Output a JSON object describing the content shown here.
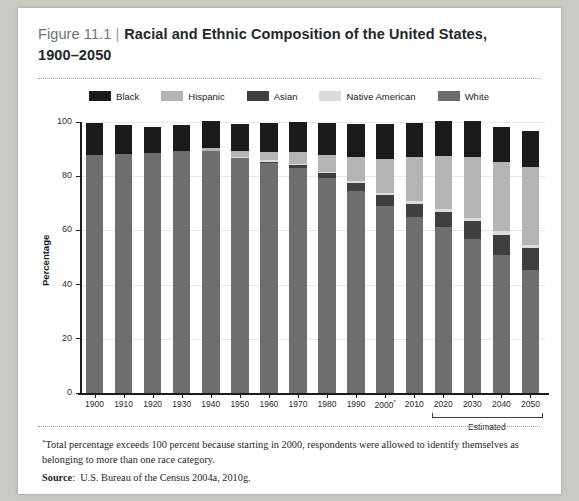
{
  "figure": {
    "label": "Figure 11.1",
    "separator": "|",
    "title_line1": "Racial and Ethnic Composition of the United States,",
    "title_line2": "1900–2050"
  },
  "footnote": {
    "marker": "*",
    "text": "Total percentage exceeds 100 percent because starting in 2000, respondents were allowed to identify themselves as belonging to more than one race category.",
    "source_label": "Source",
    "source_sep": ":",
    "source_text": "U.S. Bureau of the Census 2004a, 2010g."
  },
  "colors": {
    "black": "#1b1b1b",
    "hispanic": "#b4b4b4",
    "asian": "#3f3f3f",
    "native_american": "#dcdcdc",
    "white": "#6e6e6e",
    "axis": "#1d1d1d",
    "grid": "#e8e8e8",
    "plot_bg": "#ffffff",
    "page_bg": "#ffffff",
    "canvas_bg": "#c9c9c4"
  },
  "chart_data": {
    "type": "bar",
    "stacked": true,
    "title": "Racial and Ethnic Composition of the United States, 1900–2050",
    "xlabel": "",
    "ylabel": "Percentage",
    "ylim": [
      0,
      100
    ],
    "yticks": [
      0,
      20,
      40,
      60,
      80,
      100
    ],
    "grid": true,
    "legend_position": "top-center",
    "categories": [
      "1900",
      "1910",
      "1920",
      "1930",
      "1940",
      "1950",
      "1960",
      "1970",
      "1980",
      "1990",
      "2000*",
      "2010",
      "2020",
      "2030",
      "2040",
      "2050"
    ],
    "estimated_categories": [
      "2020",
      "2030",
      "2040",
      "2050"
    ],
    "estimated_label": "Estimated",
    "stack_order_bottom_to_top": [
      "White",
      "Asian",
      "Native American",
      "Hispanic",
      "Black"
    ],
    "series": [
      {
        "name": "White",
        "color": "#6e6e6e",
        "values": [
          87.9,
          88.1,
          88.4,
          89.3,
          89.2,
          86.7,
          84.8,
          83.2,
          79.4,
          74.5,
          69.1,
          65.0,
          61.4,
          57.0,
          51.1,
          45.4
        ]
      },
      {
        "name": "Asian",
        "color": "#3f3f3f",
        "values": [
          0.0,
          0.0,
          0.0,
          0.0,
          0.0,
          0.0,
          0.5,
          0.8,
          1.6,
          2.9,
          3.8,
          4.9,
          5.5,
          6.6,
          7.3,
          8.1
        ]
      },
      {
        "name": "Native American",
        "color": "#dcdcdc",
        "values": [
          0.0,
          0.0,
          0.0,
          0.0,
          0.0,
          0.4,
          0.5,
          0.5,
          0.6,
          0.8,
          1.0,
          1.0,
          1.1,
          1.1,
          1.2,
          1.2
        ]
      },
      {
        "name": "Hispanic",
        "color": "#b4b4b4",
        "values": [
          0.0,
          0.0,
          0.0,
          0.0,
          1.2,
          2.2,
          3.2,
          4.5,
          6.4,
          9.0,
          12.5,
          16.3,
          19.4,
          22.4,
          25.6,
          28.6
        ]
      },
      {
        "name": "Black",
        "color": "#1b1b1b",
        "values": [
          11.6,
          10.7,
          9.9,
          9.7,
          9.8,
          10.0,
          10.5,
          11.1,
          11.7,
          12.1,
          12.9,
          12.6,
          13.0,
          13.1,
          13.1,
          13.2
        ]
      }
    ],
    "legend": [
      {
        "label": "Black",
        "color": "#1b1b1b"
      },
      {
        "label": "Hispanic",
        "color": "#b4b4b4"
      },
      {
        "label": "Asian",
        "color": "#3f3f3f"
      },
      {
        "label": "Native American",
        "color": "#dcdcdc"
      },
      {
        "label": "White",
        "color": "#6e6e6e"
      }
    ]
  }
}
